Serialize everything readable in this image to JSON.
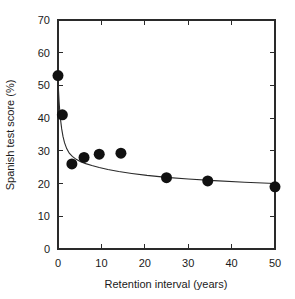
{
  "chart_data": {
    "type": "scatter",
    "title": "",
    "xlabel": "Retention interval (years)",
    "ylabel": "Spanish test score (%)",
    "xlim": [
      0,
      50
    ],
    "ylim": [
      0,
      70
    ],
    "grid": false,
    "legend": null,
    "xticks": [
      0,
      10,
      20,
      30,
      40,
      50
    ],
    "xtick_labels": [
      "0",
      "10",
      "20",
      "30",
      "40",
      "50"
    ],
    "yticks": [
      0,
      10,
      20,
      30,
      40,
      50,
      60,
      70
    ],
    "ytick_labels": [
      "0",
      "10",
      "20",
      "30",
      "40",
      "50",
      "60",
      "70"
    ],
    "marker": "filled-circle",
    "marker_color": "#111111",
    "marker_size_px": 11,
    "points": [
      {
        "x": 0.0,
        "y": 53.0
      },
      {
        "x": 1.0,
        "y": 41.0
      },
      {
        "x": 3.2,
        "y": 26.0
      },
      {
        "x": 6.0,
        "y": 28.0
      },
      {
        "x": 9.5,
        "y": 29.0
      },
      {
        "x": 14.5,
        "y": 29.3
      },
      {
        "x": 25.0,
        "y": 21.8
      },
      {
        "x": 34.5,
        "y": 20.8
      },
      {
        "x": 50.0,
        "y": 19.0
      }
    ],
    "series": [
      {
        "name": "Spanish test score",
        "x": [
          0.0,
          1.0,
          3.2,
          6.0,
          9.5,
          14.5,
          25.0,
          34.5,
          50.0
        ],
        "values": [
          53.0,
          41.0,
          26.0,
          28.0,
          29.0,
          29.3,
          21.8,
          20.8,
          19.0
        ]
      }
    ],
    "fit_curve": {
      "name": "power/decay fit",
      "color": "#2a2a2a",
      "x": [
        0.0,
        0.12,
        0.25,
        0.4,
        0.6,
        0.85,
        1.15,
        1.5,
        2.0,
        2.6,
        3.3,
        4.2,
        5.2,
        6.4,
        7.8,
        9.5,
        11.5,
        14.0,
        17.0,
        20.5,
        25.0,
        30.0,
        36.0,
        43.0,
        50.0
      ],
      "y": [
        53.0,
        48.4,
        45.1,
        42.2,
        39.4,
        36.7,
        34.4,
        32.5,
        30.7,
        29.3,
        28.3,
        27.4,
        26.7,
        26.1,
        25.5,
        24.9,
        24.3,
        23.7,
        23.1,
        22.5,
        21.9,
        21.4,
        20.9,
        20.4,
        20.0
      ]
    }
  },
  "figure": {
    "background_color": "#ffffff",
    "axis_color": "#2a2a2a"
  }
}
